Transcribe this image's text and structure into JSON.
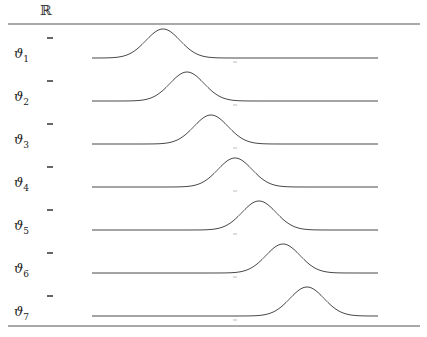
{
  "header": {
    "symbol": "ℝ"
  },
  "rows": [
    {
      "label": "ϑ",
      "sub": "1",
      "peak_x": 163
    },
    {
      "label": "ϑ",
      "sub": "2",
      "peak_x": 187
    },
    {
      "label": "ϑ",
      "sub": "3",
      "peak_x": 211
    },
    {
      "label": "ϑ",
      "sub": "4",
      "peak_x": 235
    },
    {
      "label": "ϑ",
      "sub": "5",
      "peak_x": 259
    },
    {
      "label": "ϑ",
      "sub": "6",
      "peak_x": 283
    },
    {
      "label": "ϑ",
      "sub": "7",
      "peak_x": 307
    }
  ],
  "layout": {
    "baselines": [
      58,
      101,
      144,
      187,
      230,
      273,
      316
    ],
    "curve_x_start": 92,
    "curve_x_end": 378,
    "curve_height": 29,
    "sigma": 17,
    "tick_x": 235,
    "line_color": "#333333",
    "rule_top_y": 24,
    "rule_bottom_y": 326
  }
}
